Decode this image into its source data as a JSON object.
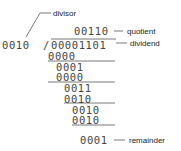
{
  "labels": {
    "divisor": "divisor",
    "quotient": "quotient",
    "dividend": "dividend",
    "remainder": "remainder"
  },
  "division": {
    "divisor": "0010",
    "separator": "/",
    "quotient": "00110",
    "dividend": "00001101",
    "steps": [
      "0000",
      "0001",
      "0000",
      "0011",
      "0010",
      "0010",
      "0010",
      "0001"
    ]
  }
}
